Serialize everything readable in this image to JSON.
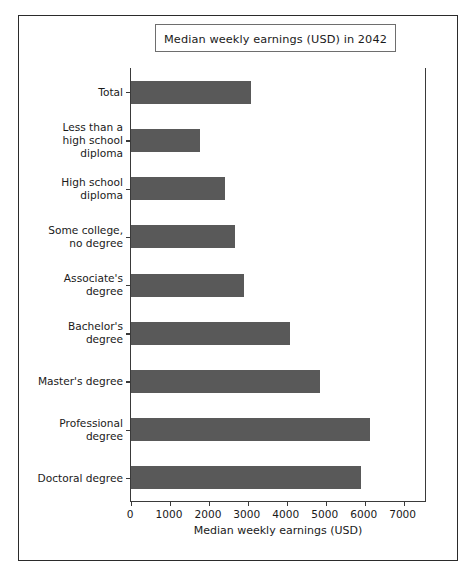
{
  "chart_data": {
    "type": "bar",
    "orientation": "horizontal",
    "title": "Median weekly earnings (USD) in 2042",
    "xlabel": "Median weekly earnings (USD)",
    "ylabel": "",
    "categories": [
      "Total",
      "Less than a\nhigh school\ndiploma",
      "High school\ndiploma",
      "Some college,\nno degree",
      "Associate's\ndegree",
      "Bachelor's\ndegree",
      "Master's degree",
      "Professional\ndegree",
      "Doctoral degree"
    ],
    "values": [
      3080,
      1770,
      2410,
      2670,
      2900,
      4080,
      4850,
      6130,
      5900
    ],
    "xlim": [
      0,
      7600
    ],
    "xticks": [
      0,
      1000,
      2000,
      3000,
      4000,
      5000,
      6000,
      7000
    ],
    "xticklabels": [
      "0",
      "1000",
      "2000",
      "3000",
      "4000",
      "5000",
      "6000",
      "7000"
    ],
    "grid": false,
    "legend": false,
    "bar_color": "#595959",
    "axes_color": "#3a3a3a",
    "title_box_border_color": "#6e6e6e",
    "figure_border_color": "#2b2b2b",
    "background_color": "#ffffff"
  }
}
